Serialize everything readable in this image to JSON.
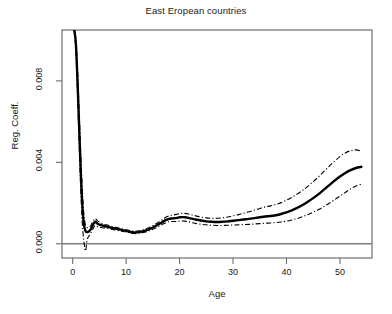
{
  "chart_data": {
    "type": "line",
    "title": "East Eropean countries",
    "xlabel": "Age",
    "ylabel": "Reg. Coeff.",
    "xlim": [
      -2,
      56
    ],
    "ylim": [
      -0.0007,
      0.0105
    ],
    "grid": false,
    "legend": null,
    "xticks": [
      0,
      10,
      20,
      30,
      40,
      50
    ],
    "xticklabels": [
      "0",
      "10",
      "20",
      "30",
      "40",
      "50"
    ],
    "yticks": [
      0.0,
      0.004,
      0.008
    ],
    "yticklabels": [
      "0.000",
      "0.004",
      "0.008"
    ],
    "reference_line": {
      "y": 0.0,
      "style": "solid",
      "color": "#7d7d7d"
    },
    "x": [
      0.3,
      0.6,
      0.9,
      1.2,
      1.5,
      1.8,
      2.1,
      2.4,
      2.7,
      3.0,
      3.4,
      3.8,
      4.2,
      4.6,
      5.0,
      5.5,
      6.0,
      6.5,
      7.0,
      7.5,
      8.0,
      8.5,
      9.0,
      9.5,
      10.0,
      10.5,
      11.0,
      11.5,
      12.0,
      12.5,
      13.0,
      13.5,
      14.0,
      14.5,
      15.0,
      15.5,
      16.0,
      16.5,
      17.0,
      17.5,
      18.0,
      18.5,
      19.0,
      19.5,
      20.0,
      20.5,
      21.0,
      21.5,
      22.0,
      22.5,
      23.0,
      24.0,
      25.0,
      26.0,
      27.0,
      28.0,
      29.0,
      30.0,
      31.0,
      32.0,
      33.0,
      34.0,
      35.0,
      36.0,
      37.0,
      38.0,
      39.0,
      40.0,
      41.0,
      42.0,
      43.0,
      44.0,
      45.0,
      46.0,
      47.0,
      48.0,
      49.0,
      50.0,
      51.0,
      52.0,
      53.0,
      54.0
    ],
    "series": [
      {
        "name": "Regression coefficient",
        "style": "solid",
        "width": 2.4,
        "color": "#000000",
        "values": [
          0.0105,
          0.0098,
          0.008,
          0.0058,
          0.0036,
          0.0019,
          0.00095,
          0.00062,
          0.00058,
          0.0006,
          0.00072,
          0.00094,
          0.00108,
          0.001,
          0.00094,
          0.0009,
          0.00086,
          0.00084,
          0.0008,
          0.00077,
          0.00074,
          0.00072,
          0.00069,
          0.00066,
          0.00063,
          0.0006,
          0.00057,
          0.00056,
          0.00056,
          0.00058,
          0.0006,
          0.00064,
          0.00068,
          0.00074,
          0.0008,
          0.00087,
          0.00095,
          0.00102,
          0.0011,
          0.00117,
          0.00122,
          0.00124,
          0.00125,
          0.00127,
          0.0013,
          0.00131,
          0.0013,
          0.00128,
          0.00125,
          0.00122,
          0.00119,
          0.00114,
          0.0011,
          0.00108,
          0.00107,
          0.00108,
          0.0011,
          0.00113,
          0.00116,
          0.00119,
          0.00122,
          0.00126,
          0.0013,
          0.00134,
          0.00136,
          0.0014,
          0.00146,
          0.00154,
          0.00164,
          0.00176,
          0.0019,
          0.00206,
          0.00224,
          0.00244,
          0.00266,
          0.00288,
          0.0031,
          0.0033,
          0.00348,
          0.00362,
          0.00372,
          0.00378
        ]
      },
      {
        "name": "Upper confidence band",
        "style": "dashdot",
        "width": 1.1,
        "color": "#000000",
        "values": [
          0.0105,
          0.0101,
          0.0086,
          0.0066,
          0.0045,
          0.0027,
          0.00145,
          0.00092,
          0.0008,
          0.0008,
          0.0009,
          0.00112,
          0.00124,
          0.00114,
          0.00106,
          0.001,
          0.00095,
          0.00092,
          0.00088,
          0.00084,
          0.00081,
          0.00078,
          0.00075,
          0.00072,
          0.00069,
          0.00066,
          0.00063,
          0.00062,
          0.00062,
          0.00064,
          0.00067,
          0.00071,
          0.00076,
          0.00082,
          0.00089,
          0.00097,
          0.00105,
          0.00113,
          0.00122,
          0.00131,
          0.00137,
          0.0014,
          0.00142,
          0.00145,
          0.00148,
          0.0015,
          0.00149,
          0.00147,
          0.00144,
          0.00141,
          0.00137,
          0.00131,
          0.00127,
          0.00125,
          0.00125,
          0.00127,
          0.00131,
          0.00137,
          0.00143,
          0.0015,
          0.00157,
          0.00165,
          0.00173,
          0.00181,
          0.00186,
          0.00193,
          0.00202,
          0.00214,
          0.00228,
          0.00244,
          0.00262,
          0.00282,
          0.00305,
          0.00329,
          0.00355,
          0.00381,
          0.00406,
          0.00428,
          0.00446,
          0.00457,
          0.00461,
          0.00455
        ]
      },
      {
        "name": "Lower confidence band",
        "style": "dashdot",
        "width": 1.1,
        "color": "#000000",
        "values": [
          0.0105,
          0.0095,
          0.0074,
          0.005,
          0.0027,
          0.001,
          0.00012,
          -0.00035,
          0.0002,
          0.00036,
          0.00052,
          0.00074,
          0.0009,
          0.00085,
          0.00081,
          0.00079,
          0.00077,
          0.00076,
          0.00073,
          0.0007,
          0.00067,
          0.00065,
          0.00063,
          0.0006,
          0.00057,
          0.00054,
          0.00051,
          0.0005,
          0.0005,
          0.00052,
          0.00054,
          0.00057,
          0.00061,
          0.00066,
          0.00071,
          0.00077,
          0.00084,
          0.00091,
          0.00098,
          0.00104,
          0.00108,
          0.00109,
          0.00109,
          0.0011,
          0.00112,
          0.00112,
          0.00111,
          0.00109,
          0.00106,
          0.00103,
          0.001,
          0.00096,
          0.00093,
          0.00091,
          0.0009,
          0.0009,
          0.00091,
          0.00092,
          0.00093,
          0.00094,
          0.00095,
          0.00097,
          0.00099,
          0.00101,
          0.00102,
          0.00104,
          0.00107,
          0.00111,
          0.00117,
          0.00124,
          0.00133,
          0.00143,
          0.00155,
          0.00168,
          0.00183,
          0.00199,
          0.00216,
          0.00234,
          0.00252,
          0.0027,
          0.00284,
          0.00292
        ]
      }
    ]
  }
}
